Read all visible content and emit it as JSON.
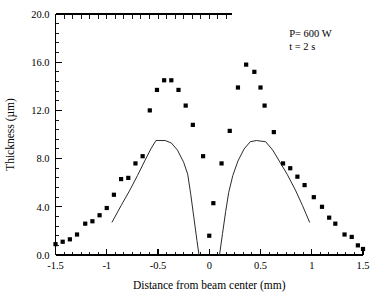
{
  "chart_data": {
    "type": "scatter",
    "title": "",
    "xlabel": "Distance from beam center (mm)",
    "ylabel": "Thickness (µm)",
    "xlim": [
      -1.5,
      1.5
    ],
    "ylim": [
      0.0,
      20.0
    ],
    "grid": false,
    "legend_position": "none",
    "x_ticks": [
      -1.5,
      -1,
      -0.5,
      0,
      0.5,
      1,
      1.5
    ],
    "x_tick_labels": [
      "-1.5",
      "-1",
      "-0.5",
      "0",
      "0.5",
      "1",
      "1.5"
    ],
    "y_ticks": [
      0.0,
      4.0,
      8.0,
      12.0,
      16.0,
      20.0
    ],
    "y_tick_labels": [
      "0.0",
      "4.0",
      "8.0",
      "12.0",
      "16.0",
      "20.0"
    ],
    "x_minor_tick_count": 5,
    "y_minor_tick_count": 4,
    "annotations": [
      {
        "text": "P= 600 W",
        "x": 0.78,
        "y": 18.1
      },
      {
        "text": "t = 2 s",
        "x": 0.78,
        "y": 17.0
      }
    ],
    "series": [
      {
        "name": "Measured thickness",
        "type": "scatter",
        "marker": "square",
        "marker_size": 4.2,
        "color": "#000000",
        "points": [
          {
            "x": -1.5,
            "y": 0.9
          },
          {
            "x": -1.43,
            "y": 1.1
          },
          {
            "x": -1.36,
            "y": 1.3
          },
          {
            "x": -1.29,
            "y": 1.7
          },
          {
            "x": -1.21,
            "y": 2.6
          },
          {
            "x": -1.14,
            "y": 2.8
          },
          {
            "x": -1.07,
            "y": 3.3
          },
          {
            "x": -1.0,
            "y": 3.9
          },
          {
            "x": -0.93,
            "y": 5.0
          },
          {
            "x": -0.86,
            "y": 6.3
          },
          {
            "x": -0.79,
            "y": 6.4
          },
          {
            "x": -0.72,
            "y": 7.6
          },
          {
            "x": -0.65,
            "y": 8.2
          },
          {
            "x": -0.58,
            "y": 12.0
          },
          {
            "x": -0.51,
            "y": 13.7
          },
          {
            "x": -0.44,
            "y": 14.5
          },
          {
            "x": -0.37,
            "y": 14.5
          },
          {
            "x": -0.3,
            "y": 13.7
          },
          {
            "x": -0.23,
            "y": 12.4
          },
          {
            "x": -0.16,
            "y": 10.8
          },
          {
            "x": -0.06,
            "y": 8.2
          },
          {
            "x": 0.0,
            "y": 1.6
          },
          {
            "x": 0.04,
            "y": 4.3
          },
          {
            "x": 0.12,
            "y": 7.6
          },
          {
            "x": 0.2,
            "y": 10.3
          },
          {
            "x": 0.28,
            "y": 13.9
          },
          {
            "x": 0.36,
            "y": 15.8
          },
          {
            "x": 0.44,
            "y": 15.2
          },
          {
            "x": 0.5,
            "y": 13.9
          },
          {
            "x": 0.54,
            "y": 12.4
          },
          {
            "x": 0.63,
            "y": 10.2
          },
          {
            "x": 0.72,
            "y": 7.6
          },
          {
            "x": 0.79,
            "y": 7.2
          },
          {
            "x": 0.86,
            "y": 6.5
          },
          {
            "x": 0.93,
            "y": 5.8
          },
          {
            "x": 1.02,
            "y": 4.8
          },
          {
            "x": 1.1,
            "y": 4.0
          },
          {
            "x": 1.17,
            "y": 3.1
          },
          {
            "x": 1.23,
            "y": 2.6
          },
          {
            "x": 1.32,
            "y": 1.7
          },
          {
            "x": 1.39,
            "y": 1.5
          },
          {
            "x": 1.45,
            "y": 0.8
          },
          {
            "x": 1.5,
            "y": 0.5
          }
        ]
      },
      {
        "name": "Model curve left",
        "type": "line",
        "color": "#2b2b2b",
        "points": [
          {
            "x": -0.95,
            "y": 2.7
          },
          {
            "x": -0.86,
            "y": 4.1
          },
          {
            "x": -0.78,
            "y": 5.3
          },
          {
            "x": -0.7,
            "y": 6.6
          },
          {
            "x": -0.63,
            "y": 7.8
          },
          {
            "x": -0.57,
            "y": 8.8
          },
          {
            "x": -0.52,
            "y": 9.5
          },
          {
            "x": -0.43,
            "y": 9.5
          },
          {
            "x": -0.37,
            "y": 9.3
          },
          {
            "x": -0.31,
            "y": 8.7
          },
          {
            "x": -0.25,
            "y": 7.7
          },
          {
            "x": -0.21,
            "y": 6.7
          },
          {
            "x": -0.18,
            "y": 5.0
          },
          {
            "x": -0.15,
            "y": 3.1
          },
          {
            "x": -0.12,
            "y": 1.2
          },
          {
            "x": -0.1,
            "y": 0.0
          }
        ]
      },
      {
        "name": "Model curve right",
        "type": "line",
        "color": "#2b2b2b",
        "points": [
          {
            "x": 0.1,
            "y": 0.0
          },
          {
            "x": 0.13,
            "y": 1.8
          },
          {
            "x": 0.16,
            "y": 3.6
          },
          {
            "x": 0.19,
            "y": 5.2
          },
          {
            "x": 0.23,
            "y": 6.6
          },
          {
            "x": 0.28,
            "y": 7.8
          },
          {
            "x": 0.34,
            "y": 8.8
          },
          {
            "x": 0.4,
            "y": 9.4
          },
          {
            "x": 0.46,
            "y": 9.5
          },
          {
            "x": 0.55,
            "y": 9.4
          },
          {
            "x": 0.62,
            "y": 8.7
          },
          {
            "x": 0.69,
            "y": 7.7
          },
          {
            "x": 0.76,
            "y": 6.7
          },
          {
            "x": 0.84,
            "y": 5.4
          },
          {
            "x": 0.91,
            "y": 4.1
          },
          {
            "x": 0.98,
            "y": 2.7
          }
        ]
      }
    ]
  }
}
